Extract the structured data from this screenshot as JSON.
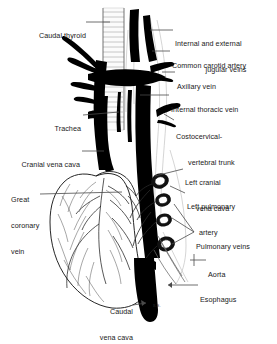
{
  "figure": {
    "background_color": "#ffffff",
    "ink_color": "#000000",
    "label_color": "#1a1a1a",
    "width": 277,
    "height": 328,
    "signature": "R.S."
  },
  "labels": [
    {
      "id": "caudal-thyroid",
      "text": "Caudal thyroid",
      "side": "left",
      "x": 36,
      "y": 19,
      "lines": [
        "Caudal thyroid"
      ]
    },
    {
      "id": "jugular-veins",
      "text": "Internal and external jugular veins",
      "side": "right",
      "x": 175,
      "y": 27,
      "lines": [
        "Internal and external",
        "jugular veins"
      ]
    },
    {
      "id": "common-carotid-artery",
      "text": "Common carotid artery",
      "side": "right",
      "x": 172,
      "y": 49,
      "lines": [
        "Common carotid artery"
      ]
    },
    {
      "id": "axillary-vein",
      "text": "Axillary vein",
      "side": "right",
      "x": 177,
      "y": 70,
      "lines": [
        "Axillary vein"
      ]
    },
    {
      "id": "internal-thoracic-vein",
      "text": "Internal thoracic vein",
      "side": "right",
      "x": 171,
      "y": 93,
      "lines": [
        "Internal thoracic vein"
      ]
    },
    {
      "id": "trachea",
      "text": "Trachea",
      "side": "left",
      "x": 50,
      "y": 112,
      "lines": [
        "Trachea"
      ]
    },
    {
      "id": "costocervical-trunk",
      "text": "Costocervical-vertebral trunk",
      "side": "right",
      "x": 176,
      "y": 124,
      "lines": [
        "Costocervical-",
        "vertebral trunk"
      ]
    },
    {
      "id": "cranial-vena-cava",
      "text": "Cranial vena cava",
      "side": "left",
      "x": 10,
      "y": 148,
      "lines": [
        "Cranial vena cava"
      ]
    },
    {
      "id": "left-cranial-vena-cava",
      "text": "Left cranial vena cava",
      "side": "right",
      "x": 185,
      "y": 166,
      "lines": [
        "Left cranial",
        "vena cava"
      ]
    },
    {
      "id": "great-coronary-vein",
      "text": "Great coronary vein",
      "side": "left",
      "x": 11,
      "y": 181,
      "lines": [
        "Great",
        "coronary",
        "vein"
      ]
    },
    {
      "id": "left-pulmonary-artery",
      "text": "Left pulmonary artery",
      "side": "right",
      "x": 187,
      "y": 190,
      "lines": [
        "Left pulmonary",
        "artery"
      ]
    },
    {
      "id": "pulmonary-veins",
      "text": "Pulmonary veins",
      "side": "right",
      "x": 196,
      "y": 230,
      "lines": [
        "Pulmonary veins"
      ]
    },
    {
      "id": "aorta",
      "text": "Aorta",
      "side": "right",
      "x": 208,
      "y": 258,
      "lines": [
        "Aorta"
      ]
    },
    {
      "id": "esophagus",
      "text": "Esophagus",
      "side": "right",
      "x": 200,
      "y": 283,
      "lines": [
        "Esophagus"
      ]
    },
    {
      "id": "caudal-vena-cava",
      "text": "Caudal vena cava",
      "side": "left",
      "x": 97,
      "y": 295,
      "lines": [
        "Caudal",
        "vena cava"
      ]
    }
  ]
}
